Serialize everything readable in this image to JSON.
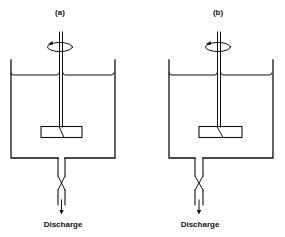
{
  "diagram": {
    "type": "stirred-tank-comparison",
    "panels": [
      {
        "id": "a",
        "label": "(a)",
        "outlet_label": "Discharge",
        "components": [
          "tank",
          "liquid-surface",
          "shaft",
          "rotation-arrow",
          "impeller",
          "outlet-pipe",
          "valve",
          "discharge-arrow"
        ],
        "impeller_position": "centered on shaft"
      },
      {
        "id": "b",
        "label": "(b)",
        "outlet_label": "Discharge",
        "components": [
          "tank",
          "liquid-surface",
          "shaft",
          "rotation-arrow",
          "impeller",
          "outlet-pipe",
          "valve",
          "discharge-arrow"
        ],
        "impeller_position": "centered on shaft, outlet offset left of shaft"
      }
    ],
    "colors": {
      "line": "#111111",
      "background": "#ffffff"
    }
  }
}
